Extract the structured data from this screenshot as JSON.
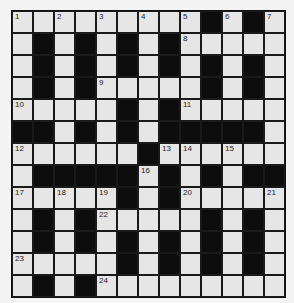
{
  "puzzle": {
    "type": "crossword",
    "rows": 13,
    "cols": 13,
    "colors": {
      "white_cell": "#e6e6e6",
      "black_cell": "#0d0d0d",
      "background": "#f4f4f4"
    },
    "layout": [
      "WWWWWWWWWBWBW",
      "WBWBWBWBWWWWW",
      "WBWBWBWBWBWBW",
      "WBWBWWWWWBWBW",
      "WWWWWBWBWWWWW",
      "BBWBWBWBBBBBW",
      "WWWWWWBWWWWWW",
      "WBBBBBWBWBWBB",
      "WWWWWBWBWWWWW",
      "WBWBWWWWWBWBW",
      "WBWBWBWBWBWBW",
      "WWWWWBWBWBWBW",
      "WBWBWWWWWWWWW"
    ],
    "numbers": [
      {
        "row": 0,
        "col": 0,
        "n": "1"
      },
      {
        "row": 0,
        "col": 2,
        "n": "2"
      },
      {
        "row": 0,
        "col": 4,
        "n": "3"
      },
      {
        "row": 0,
        "col": 6,
        "n": "4"
      },
      {
        "row": 0,
        "col": 8,
        "n": "5"
      },
      {
        "row": 0,
        "col": 10,
        "n": "6"
      },
      {
        "row": 0,
        "col": 12,
        "n": "7"
      },
      {
        "row": 1,
        "col": 8,
        "n": "8"
      },
      {
        "row": 3,
        "col": 4,
        "n": "9"
      },
      {
        "row": 4,
        "col": 0,
        "n": "10"
      },
      {
        "row": 4,
        "col": 8,
        "n": "11"
      },
      {
        "row": 6,
        "col": 0,
        "n": "12"
      },
      {
        "row": 6,
        "col": 7,
        "n": "13"
      },
      {
        "row": 6,
        "col": 8,
        "n": "14"
      },
      {
        "row": 6,
        "col": 10,
        "n": "15"
      },
      {
        "row": 7,
        "col": 6,
        "n": "16"
      },
      {
        "row": 8,
        "col": 0,
        "n": "17"
      },
      {
        "row": 8,
        "col": 2,
        "n": "18"
      },
      {
        "row": 8,
        "col": 4,
        "n": "19"
      },
      {
        "row": 8,
        "col": 8,
        "n": "20"
      },
      {
        "row": 8,
        "col": 12,
        "n": "21"
      },
      {
        "row": 9,
        "col": 4,
        "n": "22"
      },
      {
        "row": 11,
        "col": 0,
        "n": "23"
      },
      {
        "row": 12,
        "col": 4,
        "n": "24"
      }
    ]
  }
}
